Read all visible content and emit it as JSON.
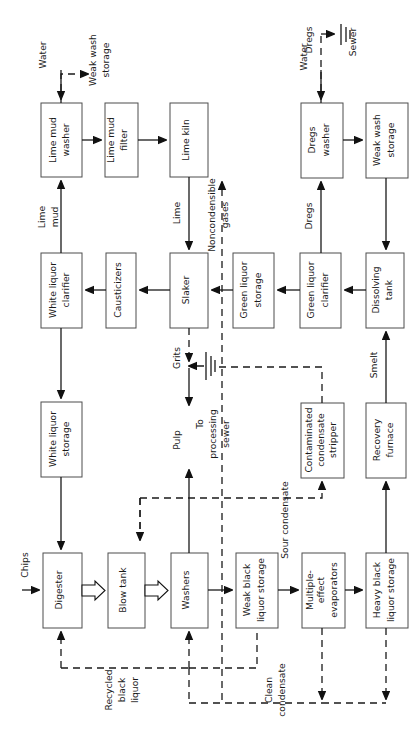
{
  "diagram": {
    "orientation": "rotated-90-ccw",
    "colors": {
      "box_stroke": "#4d4d4d",
      "line": "#1a1a1a",
      "background": "#ffffff",
      "arrow_fill": "#111111"
    }
  },
  "boxes": [
    {
      "id": "lime-mud-washer",
      "label": "Lime mud washer",
      "lines": [
        "Lime mud",
        "washer"
      ]
    },
    {
      "id": "lime-mud-filter",
      "label": "Lime mud filter",
      "lines": [
        "Lime mud",
        "filter"
      ]
    },
    {
      "id": "lime-kiln",
      "label": "Lime kiln",
      "lines": [
        "Lime kiln"
      ]
    },
    {
      "id": "white-liquor-clarifier",
      "label": "White liquor clarifier",
      "lines": [
        "White liquor",
        "clarifier"
      ]
    },
    {
      "id": "causticizers",
      "label": "Causticizers",
      "lines": [
        "Causticizers"
      ]
    },
    {
      "id": "slaker",
      "label": "Slaker",
      "lines": [
        "Slaker"
      ]
    },
    {
      "id": "white-liquor-storage",
      "label": "White liquor storage",
      "lines": [
        "White liquor",
        "storage"
      ]
    },
    {
      "id": "digester",
      "label": "Digester",
      "lines": [
        "Digester"
      ]
    },
    {
      "id": "blow-tank",
      "label": "Blow tank",
      "lines": [
        "Blow tank"
      ]
    },
    {
      "id": "washers",
      "label": "Washers",
      "lines": [
        "Washers"
      ]
    },
    {
      "id": "weak-black-liquor-storage",
      "label": "Weak black liquor storage",
      "lines": [
        "Weak black",
        "liquor storage"
      ]
    },
    {
      "id": "multiple-effect-evaporators",
      "label": "Multiple-effect evaporators",
      "lines": [
        "Multiple-",
        "effect",
        "evaporators"
      ]
    },
    {
      "id": "heavy-black-liquor-storage",
      "label": "Heavy black liquor storage",
      "lines": [
        "Heavy black",
        "liquor storage"
      ]
    },
    {
      "id": "contaminated-condensate-stripper",
      "label": "Contaminated condensate stripper",
      "lines": [
        "Contaminated",
        "condensate",
        "stripper"
      ]
    },
    {
      "id": "recovery-furnace",
      "label": "Recovery furnace",
      "lines": [
        "Recovery",
        "furnace"
      ]
    },
    {
      "id": "green-liquor-storage",
      "label": "Green liquor storage",
      "lines": [
        "Green liquor",
        "storage"
      ]
    },
    {
      "id": "green-liquor-clarifier",
      "label": "Green liquor clarifier",
      "lines": [
        "Green liquor",
        "clarifier"
      ]
    },
    {
      "id": "dissolving-tank",
      "label": "Dissolving tank",
      "lines": [
        "Dissolving",
        "tank"
      ]
    },
    {
      "id": "dregs-washer",
      "label": "Dregs washer",
      "lines": [
        "Dregs",
        "washer"
      ]
    },
    {
      "id": "weak-wash-storage",
      "label": "Weak wash storage",
      "lines": [
        "Weak wash",
        "storage"
      ]
    }
  ],
  "flow_labels": [
    {
      "id": "water-lime",
      "label": "Water",
      "lines": [
        "Water"
      ]
    },
    {
      "id": "weak-wash-out",
      "label": "Weak wash storage",
      "lines": [
        "Weak wash",
        "storage"
      ]
    },
    {
      "id": "lime-mud",
      "label": "Lime mud",
      "lines": [
        "Lime",
        "mud"
      ]
    },
    {
      "id": "lime",
      "label": "Lime",
      "lines": [
        "Lime"
      ]
    },
    {
      "id": "noncondensible",
      "label": "Noncondensible gases",
      "lines": [
        "Noncondensible",
        "gases"
      ]
    },
    {
      "id": "grits",
      "label": "Grits",
      "lines": [
        "Grits"
      ]
    },
    {
      "id": "to-processing-sewer",
      "label": "To processing sewer",
      "lines": [
        "To",
        "processing",
        "sewer"
      ]
    },
    {
      "id": "pulp",
      "label": "Pulp",
      "lines": [
        "Pulp"
      ]
    },
    {
      "id": "chips",
      "label": "Chips",
      "lines": [
        "Chips"
      ]
    },
    {
      "id": "recycled-black-liquor",
      "label": "Recycled black liquor",
      "lines": [
        "Recycled",
        "black",
        "liquor"
      ]
    },
    {
      "id": "sour-condensate",
      "label": "Sour condensate",
      "lines": [
        "Sour condensate"
      ]
    },
    {
      "id": "clean-condensate",
      "label": "Clean condensate",
      "lines": [
        "Clean",
        "condensate"
      ]
    },
    {
      "id": "smelt",
      "label": "Smelt",
      "lines": [
        "Smelt"
      ]
    },
    {
      "id": "dregs-to-washer",
      "label": "Dregs",
      "lines": [
        "Dregs"
      ]
    },
    {
      "id": "dregs-to-sewer",
      "label": "Dregs",
      "lines": [
        "Dregs"
      ]
    },
    {
      "id": "sewer",
      "label": "Sewer",
      "lines": [
        "Sewer"
      ]
    },
    {
      "id": "water-dregs",
      "label": "Water",
      "lines": [
        "Water"
      ]
    }
  ]
}
